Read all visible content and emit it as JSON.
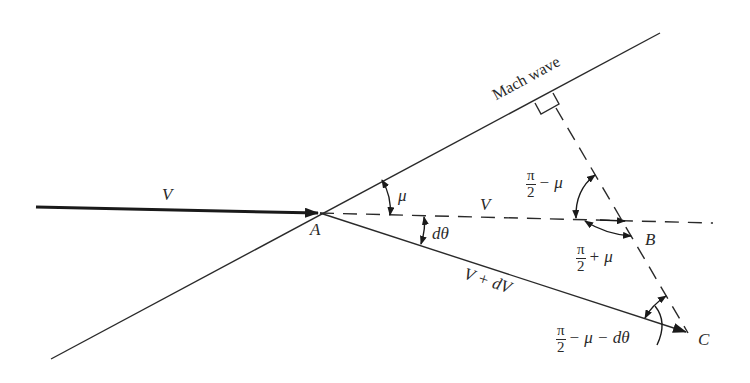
{
  "diagram": {
    "colors": {
      "line": "#2a2a2a",
      "background": "#ffffff"
    },
    "points": {
      "A": {
        "label": "A",
        "x": 320,
        "y": 213
      },
      "B": {
        "label": "B",
        "x": 627,
        "y": 220
      },
      "C": {
        "label": "C",
        "x": 688,
        "y": 333
      },
      "foot": {
        "x": 553,
        "y": 93
      }
    },
    "labels": {
      "incoming_velocity": "V",
      "dashed_velocity": "V",
      "deflected_velocity": "V + dV",
      "mach_wave": "Mach wave",
      "mu": "μ",
      "dtheta": "dθ",
      "pi": "π",
      "two": "2",
      "angle_top_rest": "− μ",
      "angle_mid_rest": "+ μ",
      "angle_bottom_rest": "− μ − dθ"
    },
    "angles": [
      {
        "name": "mu",
        "text": "μ",
        "between": [
          "Mach wave",
          "V dashed"
        ]
      },
      {
        "name": "dtheta",
        "text": "dθ",
        "between": [
          "V dashed",
          "V + dV"
        ]
      },
      {
        "name": "pi_over_2_minus_mu",
        "text": "π/2 − μ",
        "at": "B"
      },
      {
        "name": "pi_over_2_plus_mu",
        "text": "π/2 + μ",
        "at": "B"
      },
      {
        "name": "pi_over_2_minus_mu_minus_dtheta",
        "text": "π/2 − μ − dθ",
        "at": "C"
      }
    ]
  }
}
